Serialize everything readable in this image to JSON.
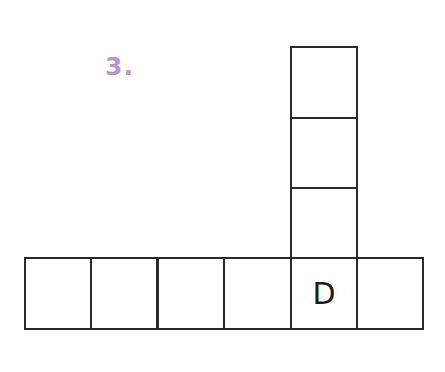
{
  "puzzle": {
    "number_label": "3.",
    "number_color": "#b593d6",
    "line_color": "#2a2a2a"
  },
  "grid": {
    "vertical": [
      {
        "letter": ""
      },
      {
        "letter": ""
      },
      {
        "letter": ""
      }
    ],
    "horizontal": [
      {
        "letter": ""
      },
      {
        "letter": ""
      },
      {
        "letter": ""
      },
      {
        "letter": ""
      },
      {
        "letter": "D"
      },
      {
        "letter": ""
      }
    ]
  }
}
